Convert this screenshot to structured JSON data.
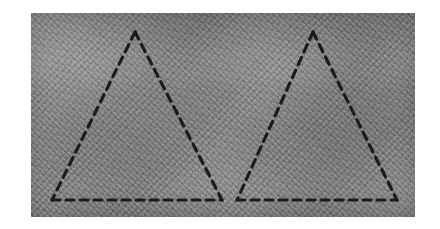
{
  "canvas": {
    "width": 440,
    "height": 229,
    "background_color": "#ffffff"
  },
  "photo": {
    "label": "textured gray surface photograph",
    "x": 31,
    "y": 13,
    "width": 384,
    "height": 204,
    "base_color": "#858585",
    "surface_description": "coarse woven fabric / concrete texture, medium gray with fine diagonal grain and faint horizontal lighting bands"
  },
  "annotation": {
    "style": "hand-drawn dashed chalk lines",
    "stroke_color": "#1b1b1b",
    "stroke_width": 3.2,
    "dash_length": 8,
    "dash_gap": 6,
    "shape_count": 2,
    "shape_type": "triangle",
    "description": "two adjacent dashed triangles sharing a common baseline"
  },
  "shapes": [
    {
      "name": "left-triangle",
      "apex": {
        "x": 135,
        "y": 32
      },
      "bottom_left": {
        "x": 52,
        "y": 200
      },
      "bottom_right": {
        "x": 222,
        "y": 200
      },
      "points": "135,32 52,200 222,200"
    },
    {
      "name": "right-triangle",
      "apex": {
        "x": 313,
        "y": 32
      },
      "bottom_left": {
        "x": 237,
        "y": 200
      },
      "bottom_right": {
        "x": 397,
        "y": 200
      },
      "points": "313,32 237,200 397,200"
    }
  ],
  "baseline": {
    "name": "shared-baseline",
    "y": 200,
    "left_segment": {
      "x1": 52,
      "x2": 222
    },
    "right_segment": {
      "x1": 237,
      "x2": 397
    },
    "gap": {
      "x1": 222,
      "x2": 237
    }
  }
}
